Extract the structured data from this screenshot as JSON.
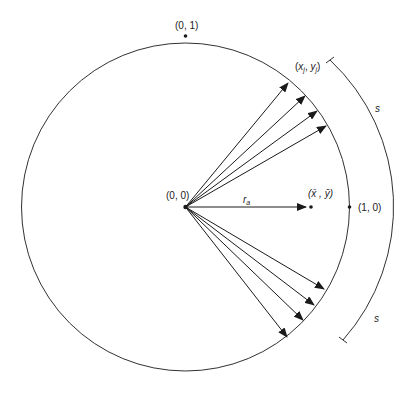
{
  "diagram": {
    "type": "unit-circle-vector-diagram",
    "labels": {
      "top_point": "(0, 1)",
      "origin": "(0, 0)",
      "right_point": "(1, 0)",
      "xj_yj": "(x_j, y_j)",
      "mean_point": "(x̄, ȳ)",
      "resultant_length": "r_a",
      "arc_upper": "s",
      "arc_lower": "s"
    },
    "text": {
      "xj_open": "(",
      "xj_x": "x",
      "xj_sub": "j",
      "xj_comma": ", ",
      "xj_y": "y",
      "xj_ysub": "j",
      "xj_close": ")",
      "mean_text": "(x̄ , ȳ)",
      "ra_r": "r",
      "ra_sub": "a",
      "s_upper": "s",
      "s_lower": "s"
    },
    "colors": {
      "stroke": "#1a1a1a",
      "background": "#ffffff"
    }
  }
}
